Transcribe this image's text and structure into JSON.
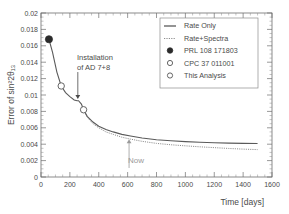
{
  "chart_data": {
    "type": "line",
    "title": "",
    "xlabel": "Time [days]",
    "ylabel": "Error of sin²2θ₁₃",
    "xlim": [
      0,
      1600
    ],
    "ylim": [
      0,
      0.02
    ],
    "xticks": [
      0,
      200,
      400,
      600,
      800,
      1000,
      1200,
      1400,
      1600
    ],
    "xtick_labels": [
      "0",
      "200",
      "400",
      "600",
      "800",
      "1000",
      "1200",
      "1400",
      "1600"
    ],
    "yticks": [
      0,
      0.002,
      0.004,
      0.006,
      0.008,
      0.01,
      0.012,
      0.014,
      0.016,
      0.018,
      0.02
    ],
    "ytick_labels": [
      "0",
      "0.002",
      "0.004",
      "0.006",
      "0.008",
      "0.01",
      "0.012",
      "0.014",
      "0.016",
      "0.018",
      "0.02"
    ],
    "grid": false,
    "legend_position": "upper-right",
    "series": [
      {
        "name": "Rate Only",
        "style": "solid",
        "color": "#5a5a5a",
        "x": [
          55,
          80,
          110,
          140,
          170,
          200,
          230,
          250,
          260,
          280,
          295,
          320,
          360,
          400,
          450,
          500,
          560,
          620,
          700,
          800,
          900,
          1000,
          1100,
          1200,
          1300,
          1400,
          1500
        ],
        "y": [
          0.0168,
          0.0152,
          0.0128,
          0.0111,
          0.0103,
          0.0098,
          0.0094,
          0.0093,
          0.0093,
          0.0089,
          0.0082,
          0.0074,
          0.0067,
          0.0062,
          0.0058,
          0.0055,
          0.0052,
          0.005,
          0.00475,
          0.00455,
          0.00442,
          0.00432,
          0.00424,
          0.00418,
          0.00413,
          0.0041,
          0.00408
        ]
      },
      {
        "name": "Rate+Spectra",
        "style": "dotted",
        "color": "#8d8d8d",
        "x": [
          295,
          320,
          360,
          400,
          450,
          500,
          560,
          620,
          700,
          800,
          900,
          1000,
          1100,
          1200,
          1300,
          1400,
          1500
        ],
        "y": [
          0.0082,
          0.0073,
          0.0065,
          0.006,
          0.0055,
          0.0052,
          0.00485,
          0.00462,
          0.00435,
          0.0041,
          0.00393,
          0.0038,
          0.00368,
          0.00358,
          0.00348,
          0.0034,
          0.00334
        ]
      }
    ],
    "points": [
      {
        "label": "PRL 108 171803",
        "marker": "filled-circle",
        "x": 55,
        "y": 0.0168
      },
      {
        "label": "CPC 37 011001",
        "marker": "open-circle",
        "x": 140,
        "y": 0.0111
      },
      {
        "label": "This Analysis",
        "marker": "open-circle",
        "x": 295,
        "y": 0.0082
      }
    ],
    "annotations": [
      {
        "name": "installation-annotation",
        "text_line1": "Installation",
        "text_line2": "of AD 7+8",
        "arrow_x": 255,
        "arrow_y_from": 0.0128,
        "arrow_y_to": 0.0095
      },
      {
        "name": "now-annotation",
        "text": "Now",
        "arrow_x": 610,
        "arrow_y_from": 0.0011,
        "arrow_y_to": 0.0046
      }
    ]
  },
  "legend": {
    "entries": [
      {
        "label": "Rate Only",
        "marker": "solid-line"
      },
      {
        "label": "Rate+Spectra",
        "marker": "dashed-line"
      },
      {
        "label": "PRL 108 171803",
        "marker": "filled-circle"
      },
      {
        "label": "CPC 37 011001",
        "marker": "open-circle"
      },
      {
        "label": "This Analysis",
        "marker": "open-circle"
      }
    ]
  },
  "colors": {
    "axis": "#6e6e6e",
    "solid_curve": "#5a5a5a",
    "dotted_curve": "#8d8d8d",
    "now_marker": "#9a9a9a",
    "text": "#4a4a4a"
  }
}
